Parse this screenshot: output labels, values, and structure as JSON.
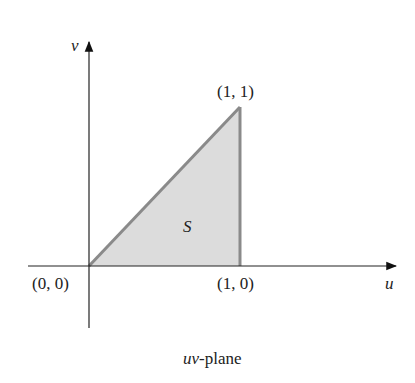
{
  "diagram": {
    "axes": {
      "horizontal_label": "u",
      "vertical_label": "v"
    },
    "region": {
      "label": "S",
      "fill": "#dcdcdc",
      "stroke": "#8a8a8a"
    },
    "points": [
      {
        "label": "(0, 0)"
      },
      {
        "label": "(1, 0)"
      },
      {
        "label": "(1, 1)"
      }
    ],
    "caption_italic": "uv",
    "caption_rest": "-plane"
  }
}
